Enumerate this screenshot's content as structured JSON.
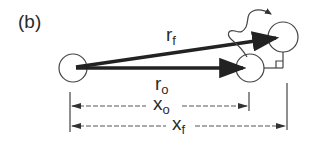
{
  "figure": {
    "panel_label": "(b)",
    "colors": {
      "ink": "#222222",
      "circle_stroke": "#444444",
      "background": "#ffffff"
    },
    "objects": [
      {
        "id": "origin-circle",
        "cx": 73,
        "cy": 68,
        "r": 14
      },
      {
        "id": "initial-position-circle",
        "cx": 250,
        "cy": 68,
        "r": 14
      },
      {
        "id": "final-position-circle",
        "cx": 283,
        "cy": 37,
        "r": 15
      }
    ],
    "vectors": [
      {
        "id": "r_f",
        "label_main": "r",
        "label_sub": "f",
        "from": [
          78,
          68
        ],
        "to": [
          283,
          37
        ]
      },
      {
        "id": "r_o",
        "label_main": "r",
        "label_sub": "o",
        "from": [
          78,
          68
        ],
        "to": [
          250,
          68
        ]
      }
    ],
    "dimensions": [
      {
        "id": "x_o",
        "label_main": "x",
        "label_sub": "o",
        "y": 106,
        "x_start": 70,
        "x_end": 249
      },
      {
        "id": "x_f",
        "label_main": "x",
        "label_sub": "f",
        "y": 126,
        "x_start": 70,
        "x_end": 287
      }
    ],
    "annotations": {
      "wavy_arrow": "motion path from initial to final position",
      "right_angle_marker": "perpendicular between initial and final position"
    }
  }
}
